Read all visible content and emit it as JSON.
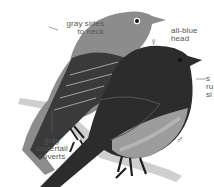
{
  "figure": {
    "colors": {
      "background": "#ffffff",
      "female_body": "#8a8a8a",
      "female_wing": "#3a3a3a",
      "male_body": "#2b2b2b",
      "male_breast": "#9a9a9a",
      "branch": "#c8c8c8",
      "label_text": "#555555"
    }
  },
  "labels": {
    "gray_sides": "gray sides\nto neck",
    "all_blue_head": "all-blue\nhead",
    "gray_undertail": "gray\nundertail\ncoverts",
    "right_truncated": "s\nru\nsi"
  },
  "symbols": {
    "female": "♀",
    "male": "♂"
  }
}
